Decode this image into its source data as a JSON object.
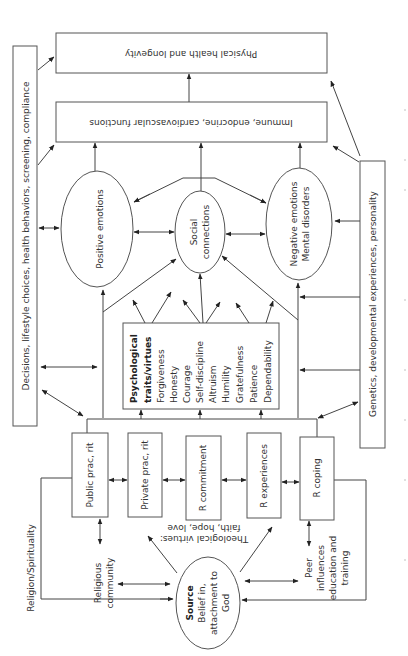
{
  "diagram": {
    "outcomes": {
      "physical_health": "Physical health and longevity",
      "physiology": "Immune, endocrine, cardiovascular functions"
    },
    "side_boxes": {
      "decisions": "Decisions, lifestyle choices, health behaviors, screening, compliance",
      "genetics": "Genetics, developmental experiences, personality"
    },
    "mediators": {
      "positive": "Positive emotions",
      "social_line1": "Social",
      "social_line2": "connections",
      "negative_line1": "Negative emotions",
      "negative_line2": "Mental disorders"
    },
    "traits": {
      "title_line1": "Psychological",
      "title_line2": "traits/virtues",
      "items": [
        "Forgiveness",
        "Honesty",
        "Courage",
        "Self-discipline",
        "Altruism",
        "Humility",
        "Gratefulness",
        "Patience",
        "Dependability"
      ]
    },
    "religion": {
      "frame_label": "Religion/Spirituality",
      "boxes": [
        "Public prac, rit",
        "Private prac, rit",
        "R commitment",
        "R experiences",
        "R coping"
      ],
      "religious_community_line1": "Religious",
      "religious_community_line2": "community",
      "theological_line1": "Theological virtues:",
      "theological_line2": "faith, hope, love",
      "peer_line1": "Peer",
      "peer_line2": "influences",
      "peer_line3": "education and",
      "peer_line4": "training",
      "source_title": "Source",
      "source_line1": "Belief in,",
      "source_line2": "attachment to",
      "source_line3": "God"
    }
  }
}
